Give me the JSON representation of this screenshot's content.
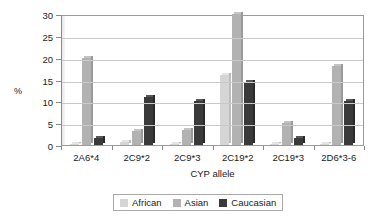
{
  "chart_data": {
    "type": "bar",
    "title": "",
    "xlabel": "CYP allele",
    "ylabel": "%",
    "ylim": [
      0,
      30
    ],
    "yticks": [
      0,
      5,
      10,
      15,
      20,
      25,
      30
    ],
    "ytick_labels": [
      "0",
      "5",
      "10",
      "15",
      "20",
      "25",
      "30"
    ],
    "grid": true,
    "legend_position": "bottom",
    "categories": [
      "2A6*4",
      "2C9*2",
      "2C9*3",
      "2C19*2",
      "2C19*3",
      "2D6*3-6"
    ],
    "series": [
      {
        "name": "African",
        "color": "#d5d5d5",
        "values": [
          0.3,
          0.6,
          0.2,
          16.0,
          0.3,
          0.3
        ]
      },
      {
        "name": "Asian",
        "color": "#b2b2b2",
        "values": [
          20.0,
          3.3,
          3.5,
          30.0,
          5.0,
          18.0
        ]
      },
      {
        "name": "Caucasian",
        "color": "#3a3a3a",
        "values": [
          1.5,
          11.0,
          10.0,
          14.5,
          1.5,
          10.0
        ]
      }
    ]
  },
  "legend": {
    "items": [
      {
        "label": "African"
      },
      {
        "label": "Asian"
      },
      {
        "label": "Caucasian"
      }
    ]
  }
}
